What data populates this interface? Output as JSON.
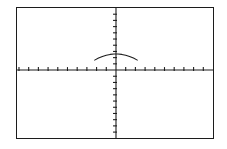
{
  "screen": {
    "width": 227,
    "height": 149,
    "background_color": "#ffffff",
    "border_color": "#1c1c1c"
  },
  "frame": {
    "x": 16,
    "y": 7,
    "width": 198,
    "height": 132,
    "border_width": 1.5
  },
  "chart_data": {
    "type": "line",
    "title": "",
    "subtitle": "",
    "xlabel": "",
    "ylabel": "",
    "grid": false,
    "legend": null,
    "legend_position": "none",
    "axis_color": "#1c1c1c",
    "curve_color": "#1c1c1c",
    "xlim": [
      -10,
      10
    ],
    "ylim": [
      -10,
      10
    ],
    "x_tick_step": 1,
    "y_tick_step": 1,
    "x_tick_count_left": 10,
    "x_tick_count_right": 10,
    "y_tick_count_above": 10,
    "y_tick_count_below": 11,
    "xticklabels": [],
    "yticklabels": [],
    "origin_px": {
      "x": 116,
      "y": 70
    },
    "series": [
      {
        "name": "curve",
        "description": "downward-opening parabola arc above the x-axis",
        "vertex": [
          0,
          2.6
        ],
        "domain": [
          -2.2,
          2.2
        ],
        "x": [
          -2.2,
          -1.8,
          -1.4,
          -1.0,
          -0.6,
          -0.2,
          0.2,
          0.6,
          1.0,
          1.4,
          1.8,
          2.2
        ],
        "y": [
          1.6,
          1.93,
          2.19,
          2.39,
          2.52,
          2.59,
          2.59,
          2.52,
          2.39,
          2.19,
          1.93,
          1.6
        ]
      }
    ],
    "annotations": []
  }
}
